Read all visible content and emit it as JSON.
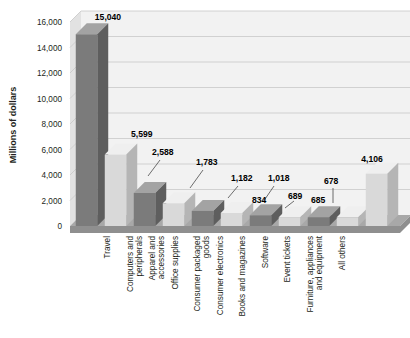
{
  "chart_data": {
    "type": "bar",
    "title": "",
    "subtitle": "",
    "xlabel": "",
    "ylabel": "Millions of dollars",
    "ylim": [
      0,
      16000
    ],
    "ytick_step": 2000,
    "grid": true,
    "legend": "none",
    "style": "3d-column",
    "categories": [
      "Travel",
      "Computers and peripherals",
      "Apparel and accessories",
      "Office supplies",
      "Consumer packaged goods",
      "Consumer electronics",
      "Books and magazines",
      "Software",
      "Event tickets",
      "Furniture, appliances and equipment",
      "All others"
    ],
    "values": [
      15040,
      5599,
      2588,
      1783,
      1182,
      1018,
      834,
      689,
      685,
      678,
      4106
    ],
    "value_labels": [
      "15,040",
      "5,599",
      "2,588",
      "1,783",
      "1,182",
      "1,018",
      "834",
      "689",
      "685",
      "678",
      "4,106"
    ],
    "ytick_labels": [
      "0",
      "2,000",
      "4,000",
      "6,000",
      "8,000",
      "10,000",
      "12,000",
      "14,000",
      "16,000"
    ],
    "ytick_values": [
      0,
      2000,
      4000,
      6000,
      8000,
      10000,
      12000,
      14000,
      16000
    ],
    "colors": {
      "bar_dark_front": "#7b7b7b",
      "bar_dark_top": "#a3a3a3",
      "bar_dark_side": "#5e5e5e",
      "bar_light_front": "#d9d9d9",
      "bar_light_top": "#efefef",
      "bar_light_side": "#b5b5b5",
      "floor": "#a8a8a8",
      "floor_side": "#8f8f8f",
      "wall": "#f2f2f2",
      "wall_side": "#e2e2e2",
      "gridline": "#c8c8c8",
      "text": "#231f20",
      "background": "#ffffff"
    },
    "bar_shades": [
      "dark",
      "light",
      "dark",
      "light",
      "dark",
      "light",
      "dark",
      "light",
      "dark",
      "light",
      "light"
    ]
  }
}
